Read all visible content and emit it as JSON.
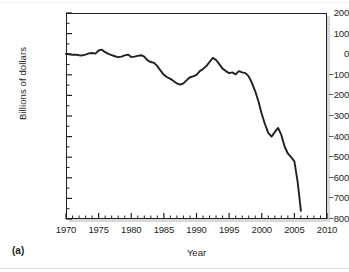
{
  "panel": {
    "label": "(a)"
  },
  "chart_data": {
    "type": "line",
    "title": "",
    "xlabel": "Year",
    "ylabel": "Billions of dollars",
    "xlim": [
      1970,
      2010
    ],
    "ylim": [
      -800,
      200
    ],
    "xticks": [
      1970,
      1975,
      1980,
      1985,
      1990,
      1995,
      2000,
      2005,
      2010
    ],
    "xtick_labels": [
      "1970",
      "1975",
      "1980",
      "1985",
      "1990",
      "1995",
      "2000",
      "2005",
      "2010"
    ],
    "yticks": [
      200,
      100,
      0,
      -100,
      -200,
      -300,
      -400,
      -500,
      -600,
      -700,
      -800
    ],
    "ytick_labels": [
      "200",
      "100",
      "0",
      "-100",
      "-200",
      "-300",
      "-400",
      "-500",
      "-600",
      "-700",
      "-800"
    ],
    "minor_xtick_interval": 1,
    "minor_ytick_interval": 50,
    "grid": false,
    "legend": null,
    "line_color": "#231f20",
    "line_width": 1.9,
    "series": [
      {
        "name": "Balance",
        "x": [
          1970,
          1970.5,
          1971,
          1971.5,
          1972,
          1972.5,
          1973,
          1973.5,
          1974,
          1974.5,
          1975,
          1975.5,
          1976,
          1976.5,
          1977,
          1977.5,
          1978,
          1978.5,
          1979,
          1979.5,
          1980,
          1980.5,
          1981,
          1981.5,
          1982,
          1982.5,
          1983,
          1983.5,
          1984,
          1984.5,
          1985,
          1985.5,
          1986,
          1986.5,
          1987,
          1987.5,
          1988,
          1988.5,
          1989,
          1989.5,
          1990,
          1990.5,
          1991,
          1991.5,
          1992,
          1992.5,
          1993,
          1993.5,
          1994,
          1994.5,
          1995,
          1995.5,
          1996,
          1996.5,
          1997,
          1997.5,
          1998,
          1998.5,
          1999,
          1999.5,
          2000,
          2000.5,
          2001,
          2001.5,
          2002,
          2002.5,
          2003,
          2003.5,
          2004,
          2004.5,
          2005,
          2005.5,
          2006
        ],
        "y": [
          2,
          0,
          -3,
          -2,
          -5,
          -6,
          -2,
          4,
          6,
          3,
          18,
          22,
          10,
          2,
          -4,
          -10,
          -14,
          -12,
          -6,
          -2,
          -14,
          -12,
          -8,
          -5,
          -12,
          -30,
          -38,
          -42,
          -58,
          -80,
          -100,
          -112,
          -120,
          -130,
          -142,
          -148,
          -142,
          -126,
          -112,
          -108,
          -100,
          -82,
          -72,
          -58,
          -38,
          -18,
          -28,
          -48,
          -70,
          -82,
          -92,
          -88,
          -98,
          -82,
          -88,
          -92,
          -108,
          -140,
          -180,
          -230,
          -290,
          -340,
          -382,
          -400,
          -378,
          -358,
          -392,
          -448,
          -482,
          -500,
          -520,
          -620,
          -760
        ]
      }
    ],
    "annotations": []
  }
}
